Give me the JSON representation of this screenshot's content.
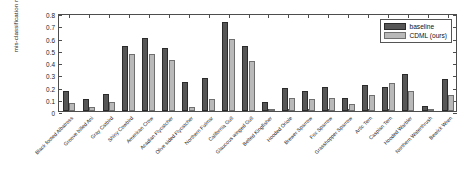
{
  "chart_data": {
    "type": "bar",
    "title": "",
    "xlabel": "",
    "ylabel": "mis-classification rates",
    "ylim": [
      0,
      0.8
    ],
    "yticks": [
      "0",
      "0.1",
      "0.2",
      "0.3",
      "0.4",
      "0.5",
      "0.6",
      "0.7",
      "0.8"
    ],
    "grid": false,
    "legend_position": "top-right",
    "categories": [
      "Black footed Albatross",
      "Groove billed Ani",
      "Gray Catbird",
      "Shiny Cowbird",
      "American Crow",
      "Acadian Flycatcher",
      "Olive sided Flycatcher",
      "Northern Fulmar",
      "California Gull",
      "Glaucous winged Gull",
      "Belted Kingfisher",
      "Hooded Oriole",
      "Brewer Sparrow",
      "Fox Sparrow",
      "Grasshopper Sparrow",
      "Artic Tern",
      "Caspian Tern",
      "Hooded Warbler",
      "Northern Waterthrush",
      "Bewick Wren"
    ],
    "series": [
      {
        "name": "baseline",
        "color": "#565656",
        "values": [
          0.165,
          0.1,
          0.14,
          0.53,
          0.595,
          0.515,
          0.235,
          0.27,
          0.73,
          0.53,
          0.075,
          0.185,
          0.16,
          0.195,
          0.11,
          0.215,
          0.195,
          0.3,
          0.045,
          0.26
        ]
      },
      {
        "name": "CDML (ours)",
        "color": "#b9b9b9",
        "values": [
          0.065,
          0.03,
          0.07,
          0.465,
          0.465,
          0.415,
          0.035,
          0.095,
          0.59,
          0.41,
          0.012,
          0.105,
          0.095,
          0.105,
          0.06,
          0.13,
          0.23,
          0.16,
          0.02,
          0.13
        ]
      }
    ]
  },
  "legend": {
    "items": [
      {
        "label": "baseline",
        "swatch": "dark-gray-swatch"
      },
      {
        "label": "CDML (ours)",
        "swatch": "light-gray-swatch"
      }
    ]
  }
}
